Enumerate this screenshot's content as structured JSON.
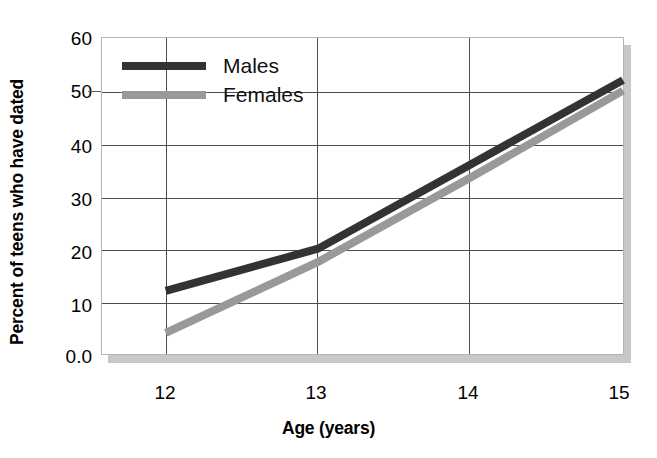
{
  "chart_data": {
    "type": "line",
    "title": "",
    "subtitle": "",
    "xlabel": "Age (years)",
    "ylabel": "Percent of teens who have dated",
    "x": [
      12,
      13,
      14,
      15
    ],
    "categories": [
      "12",
      "13",
      "14",
      "15"
    ],
    "xlim": [
      12,
      15
    ],
    "ylim": [
      0,
      60
    ],
    "grid": "horizontal-and-vertical",
    "legend_position": "inside-top-left",
    "y_ticks": [
      0,
      10,
      20,
      30,
      40,
      50,
      60
    ],
    "y_tick_labels": [
      "0.0",
      "10",
      "20",
      "30",
      "40",
      "50",
      "60"
    ],
    "x_ticks": [
      12,
      13,
      14,
      15
    ],
    "x_tick_labels": [
      "12",
      "13",
      "14",
      "15"
    ],
    "series": [
      {
        "name": "Males",
        "color": "#333333",
        "values": [
          12,
          20,
          36,
          52
        ]
      },
      {
        "name": "Females",
        "color": "#999999",
        "values": [
          4,
          17.5,
          33.5,
          50
        ]
      }
    ],
    "annotations": []
  },
  "axes": {
    "y_title": "Percent of teens who have dated",
    "x_title": "Age (years)",
    "y_tick_labels": [
      {
        "text": "60",
        "value": 60
      },
      {
        "text": "50",
        "value": 50
      },
      {
        "text": "40",
        "value": 40
      },
      {
        "text": "30",
        "value": 30
      },
      {
        "text": "20",
        "value": 20
      },
      {
        "text": "10",
        "value": 10
      },
      {
        "text": "0.0",
        "value": 0
      }
    ],
    "x_tick_labels": [
      {
        "text": "12",
        "value": 12
      },
      {
        "text": "13",
        "value": 13
      },
      {
        "text": "14",
        "value": 14
      },
      {
        "text": "15",
        "value": 15
      }
    ]
  },
  "legend": {
    "items": [
      {
        "label": "Males",
        "color": "#333333"
      },
      {
        "label": "Females",
        "color": "#999999"
      }
    ]
  },
  "colors": {
    "males": "#333333",
    "females": "#999999",
    "gridline": "#4d4d4d",
    "frame_border": "#b4b4b4",
    "shadow": "#c8c8c8",
    "background": "#ffffff",
    "text": "#000000"
  }
}
